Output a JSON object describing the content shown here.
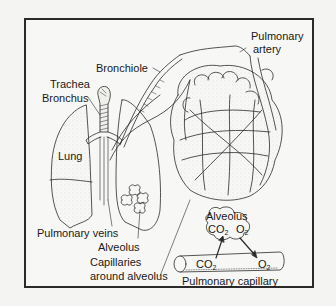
{
  "diagram": {
    "type": "anatomy-illustration",
    "labels": {
      "bronchiole": "Bronchiole",
      "pulmonary_artery_1": "Pulmonary",
      "pulmonary_artery_2": "artery",
      "trachea": "Trachea",
      "bronchus": "Bronchus",
      "lung": "Lung",
      "pulmonary_veins": "Pulmonary veins",
      "alveolus_left": "Alveolus",
      "capillaries_1": "Capillaries",
      "capillaries_2": "around alveolus",
      "alveolus_inset": "Alveolus",
      "co2_alveolus": "CO",
      "o2_alveolus": "O",
      "co2_capillary": "CO",
      "o2_capillary": "O",
      "subscript_2": "2",
      "pulmonary_capillary": "Pulmonary capillary"
    },
    "colors": {
      "line": "#2a2a2a",
      "background": "#f7f7f5",
      "stipple": "#bdbdb8"
    }
  }
}
